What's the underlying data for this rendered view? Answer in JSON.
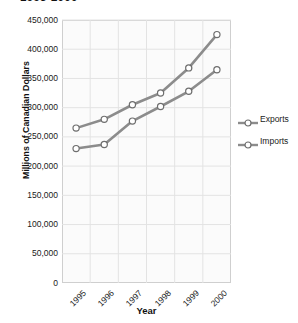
{
  "chart_data": {
    "type": "line",
    "title": "1995-2000",
    "xlabel": "Year",
    "ylabel": "Millions of Canadian Dollars",
    "categories": [
      "1995",
      "1996",
      "1997",
      "1998",
      "1999",
      "2000"
    ],
    "series": [
      {
        "name": "Exports",
        "values": [
          265000,
          280000,
          305000,
          325000,
          368000,
          425000
        ]
      },
      {
        "name": "Imports",
        "values": [
          230000,
          237000,
          277000,
          302000,
          328000,
          365000
        ]
      }
    ],
    "ylim": [
      0,
      450000
    ],
    "ytick_labels": [
      "450,000",
      "400,000",
      "350,000",
      "300,000",
      "250,000",
      "200,000",
      "150,000",
      "100,000",
      "50,000",
      "0"
    ],
    "ytick_values": [
      450000,
      400000,
      350000,
      300000,
      250000,
      200000,
      150000,
      100000,
      50000,
      0
    ],
    "ytick_step": 50000,
    "grid": true,
    "legend_position": "right",
    "marker": "open-circle",
    "line_color": "#8c8c8c",
    "marker_edge_color": "#6e6e6e",
    "marker_face_color": "#ffffff",
    "grid_color": "#e3e3e3",
    "plot_background": "#fbfbfb",
    "axis_color": "#cfcfcf"
  },
  "legend": {
    "items": [
      {
        "label": "Exports"
      },
      {
        "label": "Imports"
      }
    ]
  }
}
